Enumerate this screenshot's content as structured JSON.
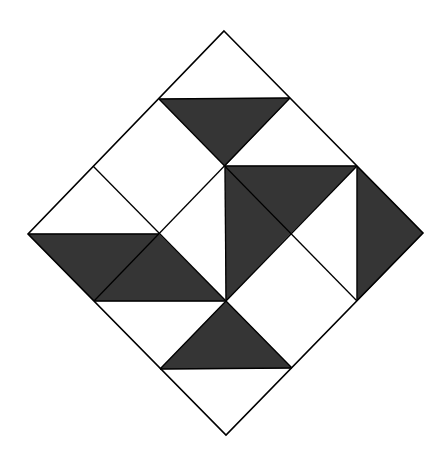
{
  "diagram": {
    "colors": {
      "dark": "#353535",
      "light": "#ffffff",
      "line": "#000000"
    },
    "outline": [
      [
        224,
        31
      ],
      [
        423,
        233
      ],
      [
        226,
        435
      ],
      [
        28,
        234
      ]
    ],
    "grid_lines": [
      [
        [
          159,
          99
        ],
        [
          357,
          301
        ]
      ],
      [
        [
          93,
          166
        ],
        [
          292,
          368
        ]
      ],
      [
        [
          290,
          98
        ],
        [
          94,
          301
        ]
      ],
      [
        [
          357,
          166
        ],
        [
          160,
          369
        ]
      ],
      [
        [
          225,
          166
        ],
        [
          226,
          301
        ]
      ]
    ],
    "dark_shapes": [
      {
        "name": "top-triangle",
        "points": [
          [
            159,
            99
          ],
          [
            290,
            98
          ],
          [
            225,
            166
          ]
        ]
      },
      {
        "name": "upper-right-triangle",
        "points": [
          [
            225,
            166
          ],
          [
            357,
            166
          ],
          [
            291,
            233
          ]
        ]
      },
      {
        "name": "center-vertical-triangle",
        "points": [
          [
            225,
            166
          ],
          [
            291,
            233
          ],
          [
            226,
            301
          ]
        ]
      },
      {
        "name": "right-triangle",
        "points": [
          [
            357,
            166
          ],
          [
            423,
            233
          ],
          [
            357,
            301
          ]
        ]
      },
      {
        "name": "left-parallelogram",
        "points": [
          [
            28,
            234
          ],
          [
            159,
            234
          ],
          [
            226,
            301
          ],
          [
            94,
            301
          ]
        ]
      },
      {
        "name": "bottom-triangle",
        "points": [
          [
            226,
            301
          ],
          [
            292,
            368
          ],
          [
            160,
            369
          ]
        ]
      }
    ],
    "extra_lines": [
      [
        [
          159,
          99
        ],
        [
          290,
          98
        ]
      ],
      [
        [
          225,
          166
        ],
        [
          357,
          166
        ]
      ],
      [
        [
          357,
          166
        ],
        [
          357,
          301
        ]
      ],
      [
        [
          28,
          234
        ],
        [
          159,
          234
        ]
      ],
      [
        [
          94,
          301
        ],
        [
          226,
          301
        ]
      ],
      [
        [
          160,
          369
        ],
        [
          292,
          368
        ]
      ]
    ]
  }
}
